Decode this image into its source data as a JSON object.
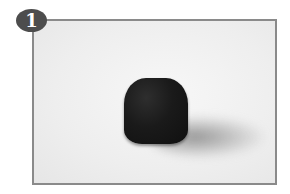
{
  "badge": {
    "number": "1"
  },
  "photo": {
    "subject": "dark rounded cube-shaped object",
    "background": "white surface",
    "colors": {
      "frame": "#8a8a8a",
      "badge": "#4d4d4d",
      "object": "#1a1a1a"
    }
  }
}
